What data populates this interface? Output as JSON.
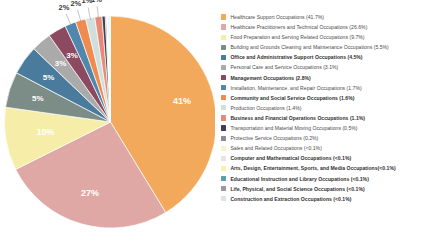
{
  "chart_data": {
    "type": "pie",
    "title": "",
    "subtitle": "",
    "xlabel": "",
    "ylabel": "",
    "legend_position": "right",
    "grid": false,
    "categories": [
      "Healthcare Support Occupations",
      "Healthcare Practitioners and Technical Occupations",
      "Food Preparation and Serving Related Occupations",
      "Building and Grounds Cleaning and Maintenance Occupations",
      "Office and Administrative Support Occupations",
      "Personal Care and Service Occupations",
      "Management Occupations",
      "Installation, Maintenance, and Repair Occupations",
      "Community and Social Service Occupations",
      "Production Occupations",
      "Business and Financial Operations Occupations",
      "Transportation and Material Moving Occupations",
      "Protective Service Occupations",
      "Sales and Related Occupations",
      "Computer and Mathematical Occupations",
      "Arts, Design, Entertainment, Sports, and Media Occupations",
      "Educational Instruction and Library Occupations",
      "Life, Physical, and Social Science Occupations",
      "Construction and Extraction Occupations"
    ],
    "values": [
      41.7,
      26.6,
      9.7,
      5.5,
      4.5,
      3.1,
      2.8,
      1.7,
      1.6,
      1.4,
      1.1,
      0.5,
      0.2,
      0.1,
      0.1,
      0.1,
      0.1,
      0.1,
      0.1
    ],
    "value_texts": [
      "41.7%",
      "26.6%",
      "9.7%",
      "5.5%",
      "4.5%",
      "3.1%",
      "2.8%",
      "1.7%",
      "1.6%",
      "1.4%",
      "1.1%",
      "0.5%",
      "0.2%",
      "<0.1%",
      "<0.1%",
      "<0.1%",
      "<0.1%",
      "<0.1%",
      "<0.1%"
    ],
    "colors": [
      "#F2A95C",
      "#DFA8A4",
      "#F5EDA8",
      "#7C8C86",
      "#4A7A9C",
      "#AAAAAA",
      "#8B4A60",
      "#4F87AE",
      "#EF8B4E",
      "#CFE0DC",
      "#E98A76",
      "#3E3F52",
      "#8C8C8C",
      "#FAF3C8",
      "#E5E5E5",
      "#FAF0B0",
      "#5E9BB5",
      "#9A9A9A",
      "#D8E4E6"
    ]
  },
  "pie": {
    "slice_labels": [
      {
        "text": "41%",
        "placement": "inside"
      },
      {
        "text": "27%",
        "placement": "inside"
      },
      {
        "text": "10%",
        "placement": "inside"
      },
      {
        "text": "5%",
        "placement": "inside"
      },
      {
        "text": "5%",
        "placement": "inside"
      },
      {
        "text": "3%",
        "placement": "inside"
      },
      {
        "text": "3%",
        "placement": "inside"
      },
      {
        "text": "2%",
        "placement": "outside"
      },
      {
        "text": "2%",
        "placement": "outside"
      },
      {
        "text": "1%",
        "placement": "outside"
      },
      {
        "text": "1%",
        "placement": "outside"
      }
    ]
  },
  "legend": {
    "items": [
      {
        "label": "Healthcare Support Occupations (41.7%)",
        "color": "#F2A95C",
        "emphasis": false
      },
      {
        "label": "Healthcare Practitioners and Technical Occupations (26.6%)",
        "color": "#DFA8A4",
        "emphasis": false
      },
      {
        "label": "Food Preparation and Serving Related Occupations (9.7%)",
        "color": "#F5EDA8",
        "emphasis": false
      },
      {
        "label": "Building and Grounds Cleaning and Maintenance Occupations (5.5%)",
        "color": "#7C8C86",
        "emphasis": false
      },
      {
        "label": "Office and Administrative Support Occupations (4.5%)",
        "color": "#4A7A9C",
        "emphasis": true
      },
      {
        "label": "Personal Care and Service Occupations (3.1%)",
        "color": "#AAAAAA",
        "emphasis": false
      },
      {
        "label": "Management Occupations (2.8%)",
        "color": "#8B4A60",
        "emphasis": true
      },
      {
        "label": "Installation, Maintenance, and Repair Occupations (1.7%)",
        "color": "#4F87AE",
        "emphasis": false
      },
      {
        "label": "Community and Social Service Occupations (1.6%)",
        "color": "#EF8B4E",
        "emphasis": true
      },
      {
        "label": "Production Occupations (1.4%)",
        "color": "#CFE0DC",
        "emphasis": false
      },
      {
        "label": "Business and Financial Operations Occupations (1.1%)",
        "color": "#E98A76",
        "emphasis": true
      },
      {
        "label": "Transportation and Material Moving Occupations (0.5%)",
        "color": "#3E3F52",
        "emphasis": false
      },
      {
        "label": "Protective Service Occupations (0.2%)",
        "color": "#8C8C8C",
        "emphasis": false
      },
      {
        "label": "Sales and Related Occupations (<0.1%)",
        "color": "#FAF3C8",
        "emphasis": false
      },
      {
        "label": "Computer and Mathematical Occupations (<0.1%)",
        "color": "#E5E5E5",
        "emphasis": true
      },
      {
        "label": "Arts, Design, Entertainment, Sports, and Media Occupations(<0.1%)",
        "color": "#FAF0B0",
        "emphasis": true
      },
      {
        "label": "Educational Instruction and Library Occupations (<0.1%)",
        "color": "#5E9BB5",
        "emphasis": true
      },
      {
        "label": "Life, Physical, and Social Science Occupations (<0.1%)",
        "color": "#9A9A9A",
        "emphasis": true
      },
      {
        "label": "Construction and Extraction Occupations (<0.1%)",
        "color": "#D8E4E6",
        "emphasis": true
      }
    ]
  }
}
